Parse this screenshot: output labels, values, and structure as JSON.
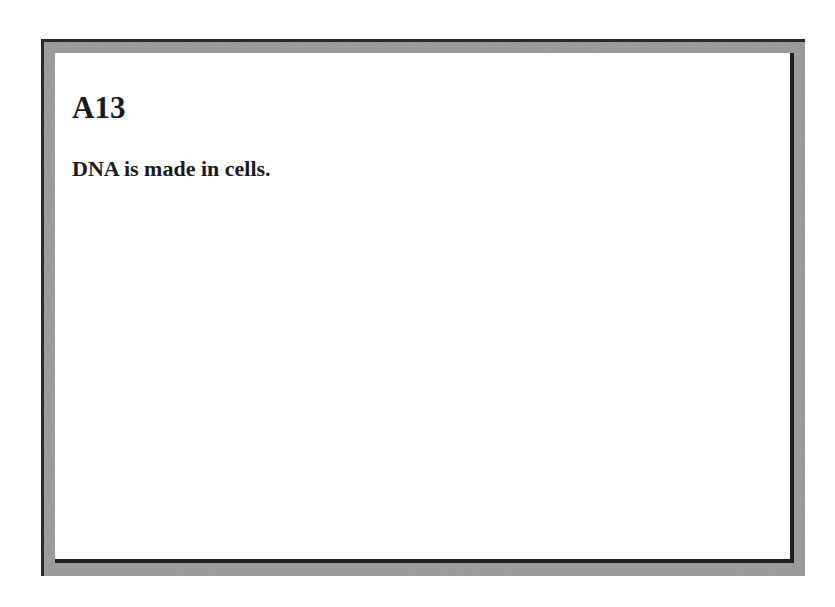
{
  "card": {
    "id": "A13",
    "statement": "DNA is made in cells."
  },
  "colors": {
    "frame_dark": "#1e1e1e",
    "frame_gray": "#9a9a9a",
    "background": "#ffffff",
    "text": "#1a1a1a"
  }
}
